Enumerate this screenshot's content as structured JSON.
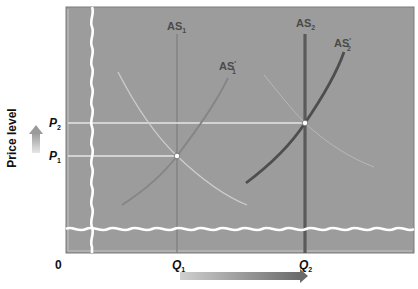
{
  "diagram": {
    "y_axis_label": "Price level",
    "origin_label": "0",
    "price_labels": {
      "p2": {
        "main": "P",
        "sub": "2"
      },
      "p1": {
        "main": "P",
        "sub": "1"
      }
    },
    "quantity_labels": {
      "q1": {
        "main": "Q",
        "sub": "1"
      },
      "q2": {
        "main": "Q",
        "sub": "2"
      }
    },
    "curve_labels": {
      "as1": {
        "main": "AS",
        "sub": "1"
      },
      "as2": {
        "main": "AS",
        "sub": "2"
      },
      "as1_prime": {
        "main": "AS",
        "sub": "1",
        "prime": "′"
      },
      "as2_prime": {
        "main": "AS",
        "sub": "2",
        "prime": "′"
      }
    },
    "colors": {
      "panel": "#9c9c9c",
      "panel_border": "#6e6e6e",
      "break_line": "#ffffff",
      "guide_line": "#e8e8e8",
      "as1_line": "#7d7d7d",
      "as2_line": "#5a5a5a",
      "as1_prime": "#858585",
      "as2_prime": "#4e4e4e",
      "ad_line": "#c8c8c8",
      "text": "#111111",
      "curve_label_text": "#4a4a4a"
    }
  }
}
